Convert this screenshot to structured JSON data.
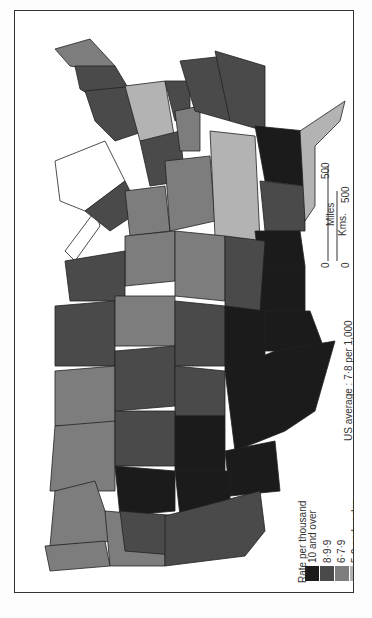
{
  "map": {
    "subject": "United States (rotated 90°), rate per thousand by state",
    "orientation": "rotated -90deg"
  },
  "legend": {
    "title": "Rate per thousand",
    "classes": [
      {
        "label": "10 and over",
        "color": "#1b1b1b"
      },
      {
        "label": "8·9·9",
        "color": "#4a4a4a"
      },
      {
        "label": "6·7·9",
        "color": "#7d7d7d"
      },
      {
        "label": "5·9 and under",
        "color": "#b3b3b3"
      }
    ]
  },
  "us_average": "US average : 7·8 per 1,000",
  "scale_bar": {
    "miles_label": "Miles",
    "kms_label": "Kms.",
    "miles_zero": "0",
    "miles_max": "500",
    "kms_zero": "0",
    "kms_max": "500"
  },
  "colors": {
    "class_1": "#1b1b1b",
    "class_2": "#4a4a4a",
    "class_3": "#7d7d7d",
    "class_4": "#b3b3b3",
    "border": "#222222",
    "background": "#ffffff"
  }
}
